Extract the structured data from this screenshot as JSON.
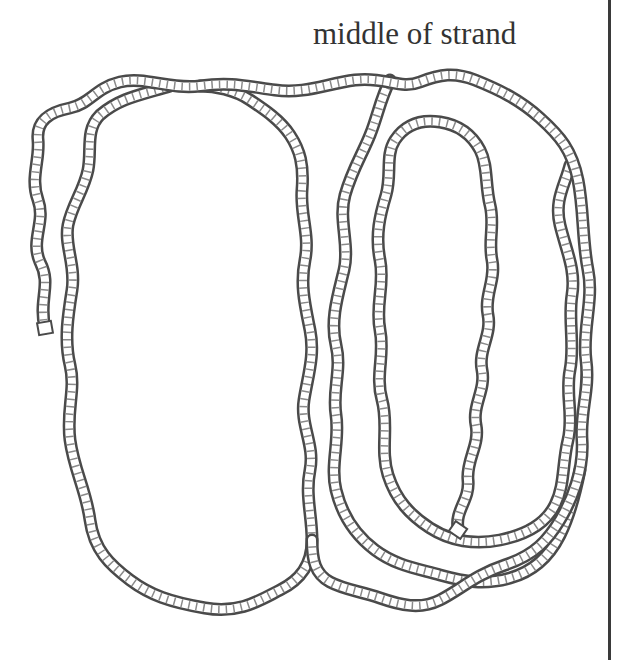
{
  "figure": {
    "caption": "middle of strand",
    "colors": {
      "rope_outline": "#4a4a4a",
      "rope_hatch": "#8a8a8a",
      "background": "#ffffff",
      "text": "#333333",
      "border": "#3a3a3a"
    },
    "elements": [
      {
        "name": "left-loop",
        "description": "large tall oval loop on the left"
      },
      {
        "name": "outer-right-loop",
        "description": "outer oval loop on the right"
      },
      {
        "name": "inner-right-loop",
        "description": "inner oval loop ending in a free end"
      },
      {
        "name": "left-free-end",
        "description": "strand end hanging at left"
      }
    ]
  }
}
